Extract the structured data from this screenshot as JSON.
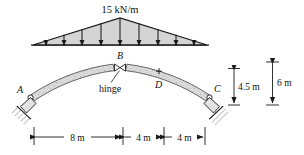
{
  "figure": {
    "type": "structural-engineering-diagram"
  },
  "load": {
    "magnitude_label": "15 kN/m",
    "distribution": "triangular",
    "peak_position": "center",
    "arrow_count": 9,
    "direction": "downward"
  },
  "labels": {
    "support_a": "A",
    "hinge_b": "B",
    "point_d": "D",
    "support_c": "C",
    "hinge_note": "hinge"
  },
  "dimensions": {
    "horizontal": [
      {
        "value": "8 m"
      },
      {
        "value": "4 m"
      },
      {
        "value": "4 m"
      }
    ],
    "vertical": [
      {
        "value": "4.5 m"
      },
      {
        "value": "6 m"
      }
    ]
  },
  "colors": {
    "stroke": "#1a1a1a",
    "load_fill": "#d4d4d4",
    "arch_fill": "#d8d8d8",
    "ground_hatch": "#8a8a8a"
  }
}
